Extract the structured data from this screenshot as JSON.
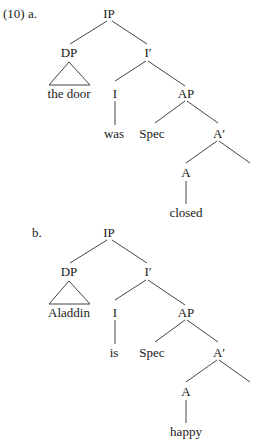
{
  "examples": [
    {
      "label": "(10) a.",
      "nodes": {
        "root": "IP",
        "subject": "DP",
        "subject_text": "the door",
        "ibar": "I′",
        "infl": "I",
        "infl_word": "was",
        "ap": "AP",
        "spec": "Spec",
        "abar": "A′",
        "adj": "A",
        "adj_word": "closed"
      }
    },
    {
      "label": "b.",
      "nodes": {
        "root": "IP",
        "subject": "DP",
        "subject_text": "Aladdin",
        "ibar": "I′",
        "infl": "I",
        "infl_word": "is",
        "ap": "AP",
        "spec": "Spec",
        "abar": "A′",
        "adj": "A",
        "adj_word": "happy"
      }
    }
  ]
}
